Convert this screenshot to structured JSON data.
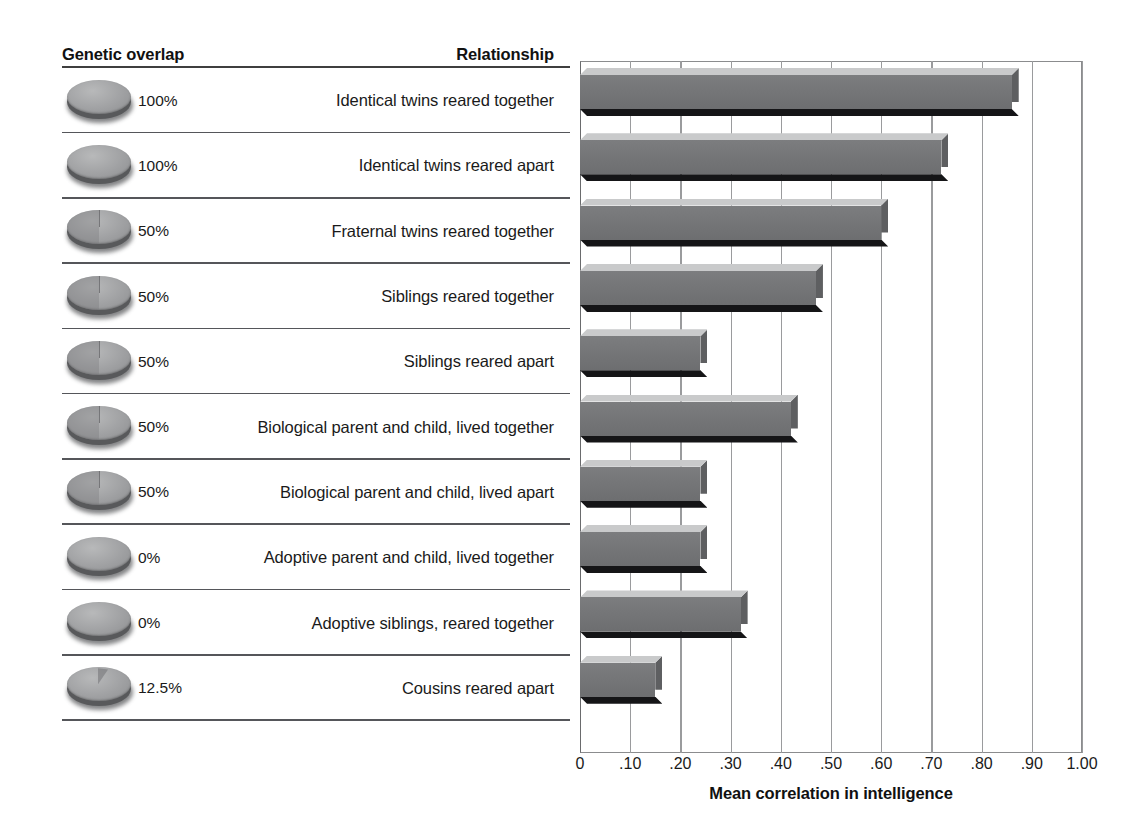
{
  "headers": {
    "genetic_overlap": "Genetic overlap",
    "relationship": "Relationship"
  },
  "axis": {
    "title": "Mean correlation in intelligence",
    "ticks": [
      "0",
      ".10",
      ".20",
      ".30",
      ".40",
      ".50",
      ".60",
      ".70",
      ".80",
      ".90",
      "1.00"
    ],
    "tick_values": [
      0,
      0.1,
      0.2,
      0.3,
      0.4,
      0.5,
      0.6,
      0.7,
      0.8,
      0.9,
      1.0
    ]
  },
  "colors": {
    "bar_face": "#757678",
    "bar_top": "#c9cacb",
    "bar_shadow": "#151517",
    "gridline": "#9a9b9d",
    "rule": "#55565a",
    "pie_disk": "#9fa0a2",
    "text": "#1a1a1a"
  },
  "rows": [
    {
      "overlap": "100%",
      "overlap_value": 100,
      "relationship": "Identical twins reared together",
      "correlation": 0.86
    },
    {
      "overlap": "100%",
      "overlap_value": 100,
      "relationship": "Identical twins reared apart",
      "correlation": 0.72
    },
    {
      "overlap": "50%",
      "overlap_value": 50,
      "relationship": "Fraternal twins reared together",
      "correlation": 0.6
    },
    {
      "overlap": "50%",
      "overlap_value": 50,
      "relationship": "Siblings reared together",
      "correlation": 0.47
    },
    {
      "overlap": "50%",
      "overlap_value": 50,
      "relationship": "Siblings reared apart",
      "correlation": 0.24
    },
    {
      "overlap": "50%",
      "overlap_value": 50,
      "relationship": "Biological parent and child, lived together",
      "correlation": 0.42
    },
    {
      "overlap": "50%",
      "overlap_value": 50,
      "relationship": "Biological parent and child, lived apart",
      "correlation": 0.24
    },
    {
      "overlap": "0%",
      "overlap_value": 0,
      "relationship": "Adoptive parent and child, lived together",
      "correlation": 0.24
    },
    {
      "overlap": "0%",
      "overlap_value": 0,
      "relationship": "Adoptive siblings, reared together",
      "correlation": 0.32
    },
    {
      "overlap": "12.5%",
      "overlap_value": 12.5,
      "relationship": "Cousins reared apart",
      "correlation": 0.15
    }
  ],
  "chart_data": {
    "type": "bar",
    "orientation": "horizontal",
    "title": "",
    "xlabel": "Mean correlation in intelligence",
    "ylabel": "Relationship",
    "xlim": [
      0,
      1.0
    ],
    "grid": true,
    "legend": "none",
    "categories": [
      "Identical twins reared together",
      "Identical twins reared apart",
      "Fraternal twins reared together",
      "Siblings reared together",
      "Siblings reared apart",
      "Biological parent and child, lived together",
      "Biological parent and child, lived apart",
      "Adoptive parent and child, lived together",
      "Adoptive siblings, reared together",
      "Cousins reared apart"
    ],
    "values": [
      0.86,
      0.72,
      0.6,
      0.47,
      0.24,
      0.42,
      0.24,
      0.24,
      0.32,
      0.15
    ],
    "secondary_series": {
      "name": "Genetic overlap",
      "unit": "%",
      "values": [
        100,
        100,
        50,
        50,
        50,
        50,
        50,
        0,
        0,
        12.5
      ]
    },
    "xticks": [
      0,
      0.1,
      0.2,
      0.3,
      0.4,
      0.5,
      0.6,
      0.7,
      0.8,
      0.9,
      1.0
    ],
    "xticklabels": [
      "0",
      ".10",
      ".20",
      ".30",
      ".40",
      ".50",
      ".60",
      ".70",
      ".80",
      ".90",
      "1.00"
    ]
  }
}
